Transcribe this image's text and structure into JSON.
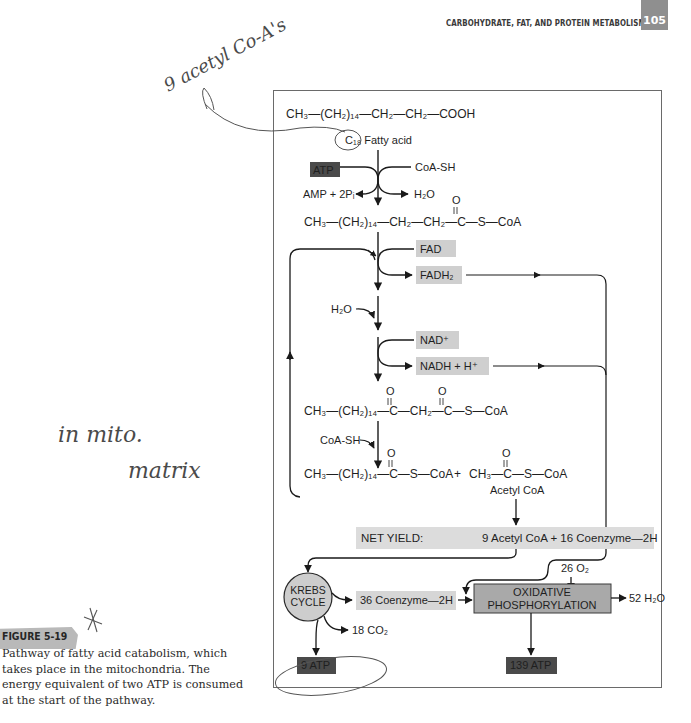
{
  "header": {
    "running_head": "CARBOHYDRATE, FAT, AND PROTEIN METABOLISM",
    "page_number": "105"
  },
  "figure": {
    "label": "FIGURE 5-19",
    "caption": "Pathway of fatty acid catabolism, which takes place in the mitochondria. The energy equivalent of two ATP is consumed at the start of the pathway."
  },
  "diagram": {
    "start_molecule": "CH₃—(CH₂)₁₄—CH₂—CH₂—COOH",
    "start_label": "C₁₈ Fatty acid",
    "activation": {
      "atp": "ATP",
      "coa_sh": "CoA-SH",
      "amp": "AMP + 2Pᵢ",
      "water": "H₂O"
    },
    "acyl_coa": "CH₃—(CH₂)₁₄—CH₂—CH₂—C—S—CoA",
    "oxidation1": {
      "in": "FAD",
      "out": "FADH₂"
    },
    "hydration": "H₂O",
    "oxidation2": {
      "in": "NAD⁺",
      "out": "NADH + H⁺"
    },
    "ketoacyl_coa": "CH₃—(CH₂)₁₄—C—CH₂—C—S—CoA",
    "thiolysis": "CoA-SH",
    "shortened_acyl": "CH₃—(CH₂)₁₄—C—S—CoA",
    "plus": "+",
    "acetyl_formula": "CH₃—C—S—CoA",
    "acetyl_label": "Acetyl CoA",
    "carbonyl_o": "O",
    "net_yield": {
      "label": "NET YIELD:",
      "value": "9 Acetyl CoA + 16 Coenzyme—2H"
    },
    "krebs": {
      "line1": "KREBS",
      "line2": "CYCLE"
    },
    "krebs_coenzyme": "36 Coenzyme—2H",
    "co2": "18 CO₂",
    "oxygen": "26 O₂",
    "oxphos": {
      "line1": "OXIDATIVE",
      "line2": "PHOSPHORYLATION"
    },
    "water_out": "52 H₂O",
    "krebs_atp": "9 ATP",
    "oxphos_atp": "139 ATP"
  },
  "annotations": {
    "top_note": "9 acetyl Co-A's",
    "side_note_line1": "in mito.",
    "side_note_line2": "matrix"
  },
  "colors": {
    "light_box": "#cfcfcf",
    "dark_box": "#4a4a4a",
    "krebs_fill": "#cdcdcd",
    "oxphos_fill": "#a9a9a9",
    "page_tab": "#8f8f8f"
  }
}
